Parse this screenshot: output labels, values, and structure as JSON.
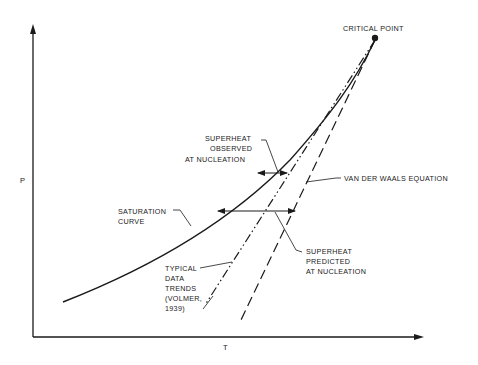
{
  "diagram": {
    "title": "",
    "axes": {
      "x_label": "T",
      "y_label": "P"
    },
    "labels": {
      "critical_point": "CRITICAL POINT",
      "superheat_observed": [
        "SUPERHEAT",
        "OBSERVED",
        "AT NUCLEATION"
      ],
      "van_der_waals": "VAN DER WAALS EQUATION",
      "saturation_curve": [
        "SATURATION",
        "CURVE"
      ],
      "superheat_predicted": [
        "SUPERHEAT",
        "PREDICTED",
        "AT NUCLEATION"
      ],
      "typical_data_trends": [
        "TYPICAL",
        "DATA",
        "TRENDS",
        "(VOLMER,",
        "1939)"
      ]
    },
    "curves": [
      {
        "name": "saturation-curve",
        "style": "solid"
      },
      {
        "name": "typical-data-trends",
        "style": "dash-dot-dot"
      },
      {
        "name": "van-der-waals-equation",
        "style": "long-dash"
      }
    ],
    "colors": {
      "ink": "#1a1a1a",
      "background": "#ffffff"
    }
  }
}
